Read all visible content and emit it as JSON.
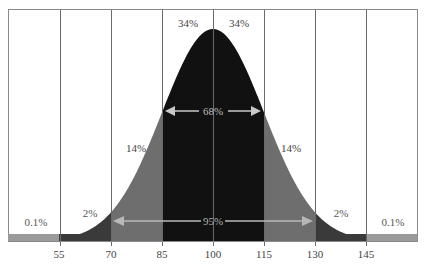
{
  "chart_data": {
    "type": "area",
    "title": "",
    "xlabel": "",
    "ylabel": "",
    "distribution": "normal",
    "mean": 100,
    "sd": 15,
    "x_ticks": [
      55,
      70,
      85,
      100,
      115,
      130,
      145
    ],
    "x_tick_labels": [
      "55",
      "70",
      "85",
      "100",
      "115",
      "130",
      "145"
    ],
    "xlim": [
      40,
      160
    ],
    "grid": {
      "vertical": true,
      "horizontal": false
    },
    "regions": [
      {
        "range": [
          40,
          55
        ],
        "percent": "0.1%",
        "color": "#9a9a9a"
      },
      {
        "range": [
          55,
          70
        ],
        "percent": "2%",
        "color": "#3a3a3a"
      },
      {
        "range": [
          70,
          85
        ],
        "percent": "14%",
        "color": "#6e6e6e"
      },
      {
        "range": [
          85,
          100
        ],
        "percent": "34%",
        "color": "#111111"
      },
      {
        "range": [
          100,
          115
        ],
        "percent": "34%",
        "color": "#111111"
      },
      {
        "range": [
          115,
          130
        ],
        "percent": "14%",
        "color": "#6e6e6e"
      },
      {
        "range": [
          130,
          145
        ],
        "percent": "2%",
        "color": "#3a3a3a"
      },
      {
        "range": [
          145,
          160
        ],
        "percent": "0.1%",
        "color": "#9a9a9a"
      }
    ],
    "annotations": [
      {
        "label": "68%",
        "from": 85,
        "to": 115,
        "type": "double-arrow"
      },
      {
        "label": "95%",
        "from": 70,
        "to": 130,
        "type": "double-arrow"
      }
    ]
  },
  "labels": {
    "region_percents": [
      "0.1%",
      "2%",
      "14%",
      "34%",
      "34%",
      "14%",
      "2%",
      "0.1%"
    ],
    "arrow_68": "68%",
    "arrow_95": "95%",
    "ticks": [
      "55",
      "70",
      "85",
      "100",
      "115",
      "130",
      "145"
    ]
  }
}
